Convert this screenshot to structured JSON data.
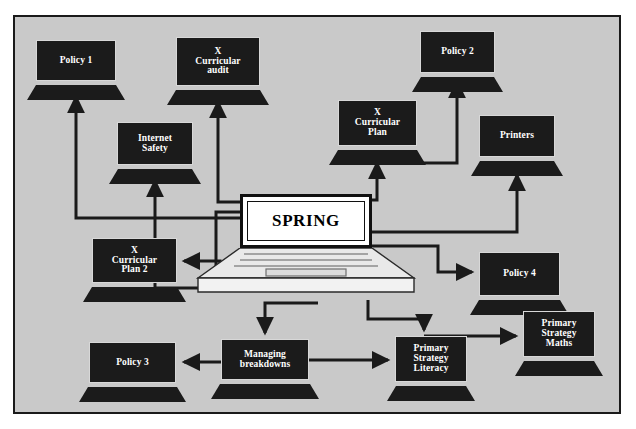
{
  "diagram": {
    "title": "SPRING",
    "frame": {
      "border_color": "#1a1a1a",
      "background": "#c9c9c9"
    },
    "hub": {
      "id": "spring",
      "label": "SPRING",
      "screen_fill": "#ffffff",
      "text_color": "#000000",
      "x": 240,
      "y": 194,
      "w": 132,
      "h": 54
    },
    "node_style": {
      "screen_fill": "#1b1b1b",
      "text_color": "#ffffff",
      "screen_border": "#d8d8d8"
    },
    "nodes": [
      {
        "id": "policy-1",
        "label": "Policy 1",
        "lines": [
          "Policy 1"
        ],
        "x": 36,
        "y": 40,
        "w": 80,
        "h": 41,
        "font": 9.5
      },
      {
        "id": "x-curricular-audit",
        "label": "X Curricular audit",
        "lines": [
          "X",
          "Curricular",
          "audit"
        ],
        "x": 176,
        "y": 37,
        "w": 84,
        "h": 49,
        "font": 9.5
      },
      {
        "id": "policy-2",
        "label": "Policy 2",
        "lines": [
          "Policy 2"
        ],
        "x": 420,
        "y": 31,
        "w": 75,
        "h": 42,
        "font": 9.5
      },
      {
        "id": "internet-safety",
        "label": "Internet Safety",
        "lines": [
          "Internet",
          "Safety"
        ],
        "x": 117,
        "y": 122,
        "w": 76,
        "h": 43,
        "font": 9.5
      },
      {
        "id": "x-curricular-plan",
        "label": "X Curricular Plan",
        "lines": [
          "X",
          "Curricular",
          "Plan"
        ],
        "x": 338,
        "y": 100,
        "w": 79,
        "h": 46,
        "font": 9.5
      },
      {
        "id": "printers",
        "label": "Printers",
        "lines": [
          "Printers"
        ],
        "x": 479,
        "y": 115,
        "w": 76,
        "h": 42,
        "font": 9.5
      },
      {
        "id": "x-curricular-plan-2",
        "label": "X Curricular Plan 2",
        "lines": [
          "X",
          "Curricular",
          "Plan 2"
        ],
        "x": 92,
        "y": 238,
        "w": 85,
        "h": 45,
        "font": 9.5
      },
      {
        "id": "policy-4",
        "label": "Policy 4",
        "lines": [
          "Policy 4"
        ],
        "x": 479,
        "y": 252,
        "w": 81,
        "h": 44,
        "font": 9.5
      },
      {
        "id": "policy-3",
        "label": "Policy 3",
        "lines": [
          "Policy 3"
        ],
        "x": 89,
        "y": 342,
        "w": 87,
        "h": 41,
        "font": 9.5
      },
      {
        "id": "managing-breakdowns",
        "label": "Managing breakdowns",
        "lines": [
          "Managing",
          "breakdowns"
        ],
        "x": 221,
        "y": 339,
        "w": 88,
        "h": 41,
        "font": 9.5
      },
      {
        "id": "primary-strategy-literacy",
        "label": "Primary Strategy Literacy",
        "lines": [
          "Primary",
          "Strategy",
          "Literacy"
        ],
        "x": 395,
        "y": 336,
        "w": 72,
        "h": 46,
        "font": 9.5
      },
      {
        "id": "primary-strategy-maths",
        "label": "Primary Strategy Maths",
        "lines": [
          "Primary",
          "Strategy",
          "Maths"
        ],
        "x": 523,
        "y": 311,
        "w": 72,
        "h": 46,
        "font": 9.5
      }
    ],
    "edges": [
      {
        "id": "spring-to-policy-1",
        "from": "spring",
        "to": "policy-1"
      },
      {
        "id": "spring-to-x-curricular-audit",
        "from": "spring",
        "to": "x-curricular-audit"
      },
      {
        "id": "spring-to-internet-safety",
        "from": "spring",
        "to": "internet-safety"
      },
      {
        "id": "spring-to-x-curricular-plan",
        "from": "spring",
        "to": "x-curricular-plan"
      },
      {
        "id": "x-curricular-plan-to-policy-2",
        "from": "x-curricular-plan",
        "to": "policy-2"
      },
      {
        "id": "spring-to-printers",
        "from": "spring",
        "to": "printers"
      },
      {
        "id": "spring-to-x-curricular-plan-2",
        "from": "spring",
        "to": "x-curricular-plan-2"
      },
      {
        "id": "spring-to-policy-4",
        "from": "spring",
        "to": "policy-4"
      },
      {
        "id": "spring-to-managing-breakdowns",
        "from": "spring",
        "to": "managing-breakdowns"
      },
      {
        "id": "spring-to-primary-strategy-literacy",
        "from": "spring",
        "to": "primary-strategy-literacy"
      },
      {
        "id": "managing-breakdowns-to-policy-3",
        "from": "managing-breakdowns",
        "to": "policy-3"
      },
      {
        "id": "managing-breakdowns-to-primary-strategy-literacy",
        "from": "managing-breakdowns",
        "to": "primary-strategy-literacy"
      },
      {
        "id": "policy-4-to-primary-strategy-maths",
        "from": "policy-4",
        "to": "primary-strategy-maths"
      }
    ]
  }
}
